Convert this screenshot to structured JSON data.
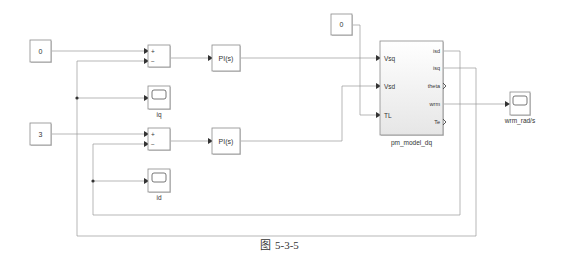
{
  "constants": {
    "iq_ref": "0",
    "id_ref": "3",
    "load_torque": "0"
  },
  "sum_blocks": {
    "plus": "+",
    "minus": "−"
  },
  "controllers": {
    "pi_q": "PI(s)",
    "pi_d": "PI(s)"
  },
  "scopes": {
    "iq": "iq",
    "id": "id",
    "wrm": "wrm_rad/s"
  },
  "subsystem": {
    "name": "pm_model_dq",
    "inputs": [
      "Vsq",
      "Vsd",
      "TL"
    ],
    "outputs": [
      "isd",
      "isq",
      "theta",
      "wrm",
      "Te"
    ]
  },
  "caption": {
    "icon": "图",
    "text": "5-3-5"
  }
}
